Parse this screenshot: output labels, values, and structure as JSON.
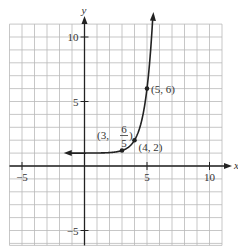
{
  "chart_data": {
    "type": "line",
    "title": "",
    "xlabel": "x",
    "ylabel": "y",
    "function": "y = 5^(x-4) + 1",
    "horizontal_asymptote": 1,
    "xlim": [
      -6,
      11
    ],
    "ylim": [
      -6,
      11
    ],
    "grid": true,
    "x_ticks": [
      {
        "value": -5,
        "label": "−5"
      },
      {
        "value": 5,
        "label": "5"
      },
      {
        "value": 10,
        "label": "10"
      }
    ],
    "y_ticks": [
      {
        "value": 10,
        "label": "10"
      },
      {
        "value": 5,
        "label": "5"
      },
      {
        "value": -5,
        "label": "−5"
      }
    ],
    "points": [
      {
        "x": 3,
        "y": 1.2,
        "label_prefix": "(3, ",
        "label_num": "6",
        "label_den": "5",
        "label_suffix": ")"
      },
      {
        "x": 4,
        "y": 2,
        "label": "(4, 2)"
      },
      {
        "x": 5,
        "y": 6,
        "label": "(5, 6)"
      }
    ],
    "curve_sample": {
      "x": [
        -2,
        -1,
        0,
        1,
        2,
        3,
        3.5,
        4,
        4.5,
        5,
        5.3,
        5.6
      ],
      "y": [
        1.0,
        1.0,
        1.0,
        1.01,
        1.04,
        1.2,
        1.45,
        2,
        3.24,
        6,
        9.1,
        14.1
      ]
    }
  },
  "axes": {
    "x_label": "x",
    "y_label": "y"
  }
}
